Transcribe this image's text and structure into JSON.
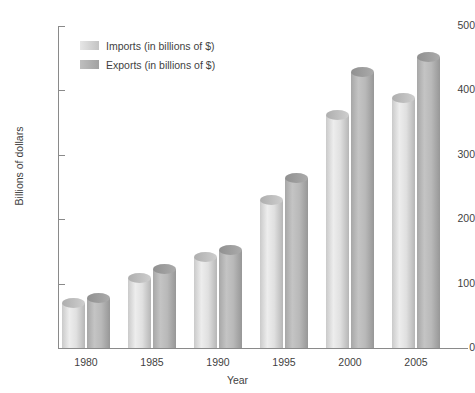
{
  "chart_data": {
    "type": "bar",
    "title": "",
    "subtitle": "",
    "xlabel": "Year",
    "ylabel": "Billions of dollars",
    "categories": [
      "1980",
      "1985",
      "1990",
      "1995",
      "2000",
      "2005"
    ],
    "series": [
      {
        "name": "Imports (in billions of $)",
        "values": [
          70,
          108,
          141,
          230,
          362,
          388
        ],
        "color": "#d9d9d9"
      },
      {
        "name": "Exports (in billions of $)",
        "values": [
          78,
          122,
          152,
          264,
          428,
          452
        ],
        "color": "#b4b4b4"
      }
    ],
    "ylim": [
      0,
      500
    ],
    "yticks": [
      0,
      100,
      200,
      300,
      400,
      500
    ],
    "ytick_labels": [
      "0",
      "100",
      "200",
      "300",
      "400",
      "500"
    ],
    "grid": false,
    "legend_position": "top-left",
    "style": "3d-cylinder"
  },
  "legend": {
    "entries": [
      {
        "label": "Imports (in billions of $)",
        "color": "#d9d9d9"
      },
      {
        "label": "Exports (in billions of $)",
        "color": "#b4b4b4"
      }
    ]
  },
  "axes": {
    "y_title": "Billions of dollars",
    "x_title": "Year"
  }
}
